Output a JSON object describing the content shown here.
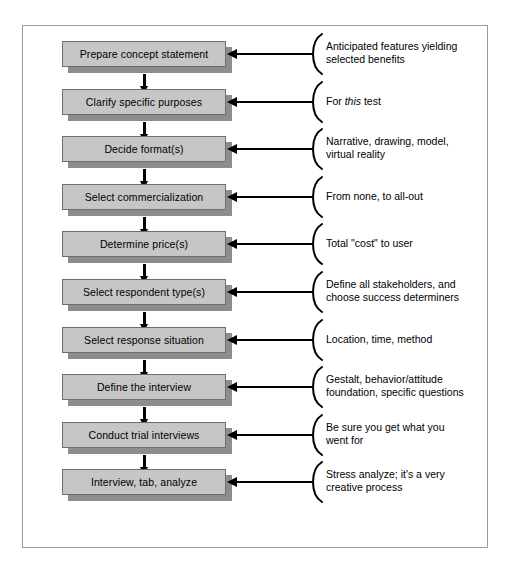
{
  "diagram": {
    "colors": {
      "box_fill": "#c6c6c6",
      "box_border": "#6e6e6e",
      "box_shadow": "#8d8d8d",
      "frame_border": "#9a9a9a",
      "arrow": "#000000",
      "text": "#000000",
      "background": "#ffffff"
    },
    "steps": [
      {
        "label": "Prepare concept statement"
      },
      {
        "label": "Clarify specific purposes"
      },
      {
        "label": "Decide format(s)"
      },
      {
        "label": "Select commercialization"
      },
      {
        "label": "Determine price(s)"
      },
      {
        "label": "Select respondent type(s)"
      },
      {
        "label": "Select response situation"
      },
      {
        "label": "Define the interview"
      },
      {
        "label": "Conduct trial interviews"
      },
      {
        "label": "Interview, tab, analyze"
      }
    ],
    "annotations": [
      {
        "line1": "Anticipated features yielding",
        "line2": "selected benefits",
        "italic_word": ""
      },
      {
        "line1": "For this test",
        "line2": "",
        "italic_word": "this"
      },
      {
        "line1": "Narrative, drawing, model,",
        "line2": "virtual reality",
        "italic_word": ""
      },
      {
        "line1": "From none, to all-out",
        "line2": "",
        "italic_word": ""
      },
      {
        "line1": "Total \"cost\" to user",
        "line2": "",
        "italic_word": ""
      },
      {
        "line1": "Define all stakeholders, and",
        "line2": "choose success determiners",
        "italic_word": ""
      },
      {
        "line1": "Location, time, method",
        "line2": "",
        "italic_word": ""
      },
      {
        "line1": "Gestalt, behavior/attitude",
        "line2": "foundation, specific questions",
        "italic_word": ""
      },
      {
        "line1": "Be sure you get what you",
        "line2": "went for",
        "italic_word": ""
      },
      {
        "line1": "Stress analyze; it's a very",
        "line2": "creative process",
        "italic_word": ""
      }
    ],
    "icons": {
      "down_arrow": "arrow-down-icon",
      "left_arrow": "arrow-left-icon",
      "brace": "curly-brace-icon"
    }
  }
}
